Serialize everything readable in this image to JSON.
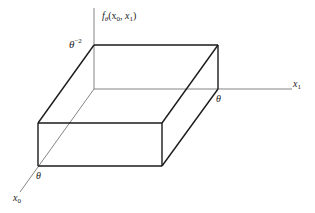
{
  "figure": {
    "type": "3d-box-density-diagram",
    "axes": {
      "vertical_label_func": "f",
      "vertical_label_sub": "θ",
      "vertical_label_args": "(x",
      "vertical_label_arg0_sub": "0",
      "vertical_label_sep": ", x",
      "vertical_label_arg1_sub": "1",
      "vertical_label_close": ")",
      "x1_label": "x",
      "x1_sub": "1",
      "x0_label": "x",
      "x0_sub": "0"
    },
    "annotations": {
      "height_base": "θ",
      "height_exp": "−2",
      "x1_extent": "θ",
      "x0_extent": "θ"
    },
    "colors": {
      "box_edge": "#1a1a1a",
      "axis": "#555555",
      "background": "#ffffff"
    }
  }
}
